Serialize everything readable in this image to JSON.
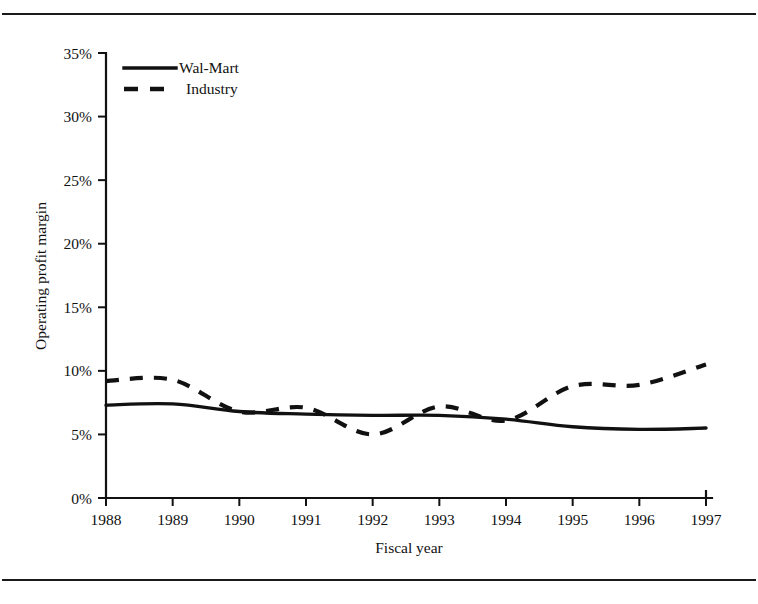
{
  "figure": {
    "has_top_rule": true,
    "has_bottom_rule": true,
    "ink_color": "#111111",
    "background_color": "#ffffff"
  },
  "chart_data": {
    "type": "line",
    "title": "",
    "xlabel": "Fiscal year",
    "ylabel": "Operating profit margin",
    "categories": [
      "1988",
      "1989",
      "1990",
      "1991",
      "1992",
      "1993",
      "1994",
      "1995",
      "1996",
      "1997"
    ],
    "x": [
      1988,
      1989,
      1990,
      1991,
      1992,
      1993,
      1994,
      1995,
      1996,
      1997
    ],
    "xlim": [
      1988,
      1997
    ],
    "ylim": [
      0,
      35
    ],
    "y_tick_labels": [
      "0%",
      "5%",
      "10%",
      "15%",
      "20%",
      "25%",
      "30%",
      "35%"
    ],
    "y_tick_values": [
      0,
      5,
      10,
      15,
      20,
      25,
      30,
      35
    ],
    "y_unit": "%",
    "grid": false,
    "legend_position": "top-left",
    "series": [
      {
        "name": "Wal-Mart",
        "style": "solid",
        "color": "#111111",
        "values": [
          7.3,
          7.4,
          6.8,
          6.6,
          6.5,
          6.5,
          6.2,
          5.6,
          5.4,
          5.5
        ]
      },
      {
        "name": "Industry",
        "style": "dashed",
        "color": "#111111",
        "values": [
          9.2,
          9.3,
          6.8,
          7.1,
          5.0,
          7.2,
          6.1,
          8.8,
          8.9,
          10.5
        ]
      }
    ]
  },
  "axes": {
    "y_title": "Operating profit margin",
    "x_title": "Fiscal year",
    "y_ticks": [
      "35%",
      "30%",
      "25%",
      "20%",
      "15%",
      "10%",
      "5%",
      "0%"
    ],
    "x_ticks": [
      "1988",
      "1989",
      "1990",
      "1991",
      "1992",
      "1993",
      "1994",
      "1995",
      "1996",
      "1997"
    ]
  },
  "legend": {
    "entries": [
      {
        "label": "Wal-Mart",
        "style": "solid"
      },
      {
        "label": "Industry",
        "style": "dashed"
      }
    ]
  }
}
